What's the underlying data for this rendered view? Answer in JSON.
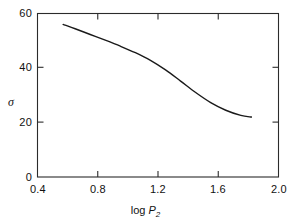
{
  "chart_data": {
    "type": "line",
    "title": "",
    "subtitle": "",
    "xlabel": "log P2",
    "ylabel": "σ",
    "xlim": [
      0.4,
      2.0
    ],
    "ylim": [
      0,
      60
    ],
    "grid": false,
    "legend": null,
    "xticks": [
      0.4,
      0.8,
      1.2,
      1.6,
      2.0
    ],
    "xtick_labels": [
      "0.4",
      "0.8",
      "1.2",
      "1.6",
      "2.0"
    ],
    "yticks": [
      0,
      20,
      40,
      60
    ],
    "ytick_labels": [
      "0",
      "20",
      "40",
      "60"
    ],
    "series": [
      {
        "name": "sigma vs log P2",
        "x": [
          0.57,
          0.65,
          0.75,
          0.85,
          0.95,
          1.05,
          1.15,
          1.25,
          1.35,
          1.45,
          1.55,
          1.65,
          1.75,
          1.82
        ],
        "y": [
          56.0,
          54.4,
          52.3,
          50.2,
          48.0,
          45.6,
          42.8,
          39.3,
          35.2,
          31.0,
          27.3,
          24.5,
          22.6,
          22.0
        ]
      }
    ],
    "annotations": []
  },
  "axis": {
    "x_title_prefix": "log ",
    "x_title_symbol": "P",
    "x_title_subscript": "2",
    "y_title_symbol": "σ"
  },
  "style": {
    "line_color": "#1a1a1a",
    "axis_color": "#2b2b2b",
    "background": "#ffffff",
    "line_width": "1.4"
  }
}
